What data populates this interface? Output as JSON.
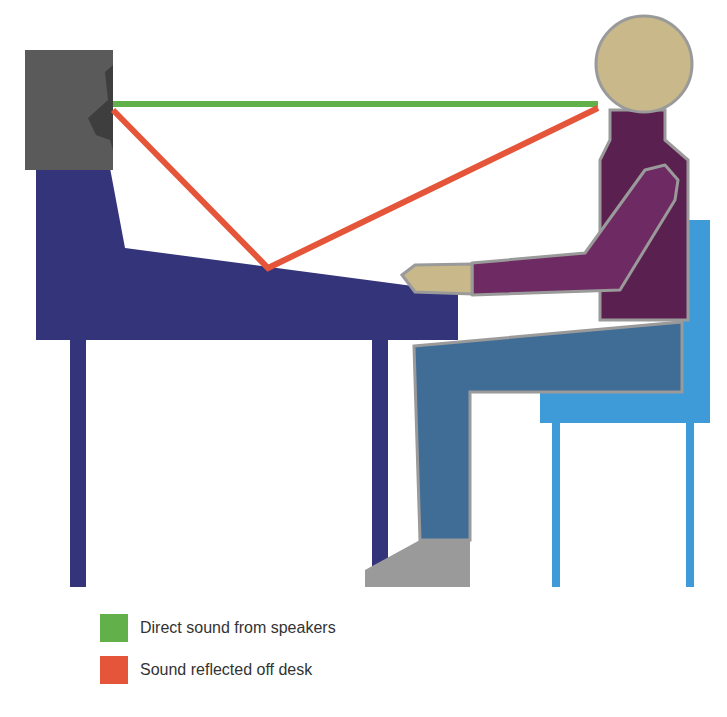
{
  "diagram": {
    "elements": {
      "speaker": {
        "label": "speaker",
        "color": "#5a5a5a"
      },
      "desk": {
        "label": "desk",
        "color": "#34347a"
      },
      "listener": {
        "label": "seated listener",
        "head_color": "#c9b889",
        "torso_color": "#5a2150",
        "arm_color": "#6e2a63",
        "legs_color": "#3f6d96",
        "shoe_color": "#9a9a9a"
      },
      "chair": {
        "label": "chair",
        "color": "#3f9ad8"
      }
    },
    "paths": [
      {
        "name": "direct",
        "color": "#62b04a"
      },
      {
        "name": "reflected",
        "color": "#e5553a"
      }
    ]
  },
  "legend": {
    "items": [
      {
        "label": "Direct sound from speakers",
        "color": "#62b04a"
      },
      {
        "label": "Sound reflected off desk",
        "color": "#e5553a"
      }
    ]
  }
}
